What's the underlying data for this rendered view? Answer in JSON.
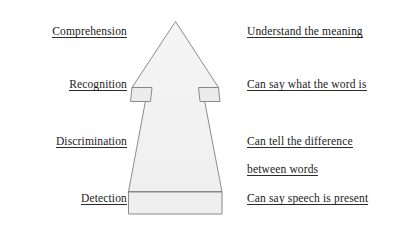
{
  "diagram": {
    "background_color": "#ffffff",
    "arrow": {
      "name": "upward-arrow",
      "fill_color": "#f2f2f2",
      "stroke_color": "#7a7a7a",
      "direction": "up",
      "segments": 2,
      "divider_label": ""
    },
    "levels": [
      {
        "stage": "Comprehension",
        "description": "Understand the meaning",
        "order": 1
      },
      {
        "stage": "Recognition",
        "description": "Can say what the word is",
        "order": 2
      },
      {
        "stage": "Discrimination",
        "description_line1": "Can tell the difference",
        "description_line2": "between words",
        "order": 3
      },
      {
        "stage": "Detection",
        "description": "Can say speech is present",
        "order": 4
      }
    ]
  }
}
